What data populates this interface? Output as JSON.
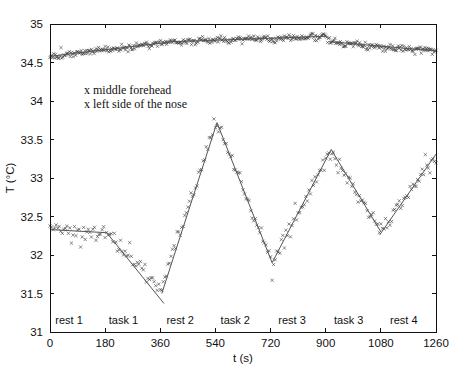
{
  "figure": {
    "background": "#ffffff",
    "axis_color": "#111111",
    "marker_color": "#2e2e2e",
    "fit_line_color": "#555555",
    "text_color": "#111111"
  },
  "chart_data": {
    "type": "scatter",
    "title": "",
    "xlabel": "t (s)",
    "ylabel": "T (°C)",
    "xlim": [
      0,
      1260
    ],
    "ylim": [
      31,
      35
    ],
    "xticks": [
      0,
      180,
      360,
      540,
      720,
      900,
      1080,
      1260
    ],
    "yticks": [
      31,
      31.5,
      32,
      32.5,
      33,
      33.5,
      34,
      34.5,
      35
    ],
    "grid": false,
    "legend_position": "inside-top-left",
    "legend": [
      "x middle forehead",
      "x left side of the nose"
    ],
    "phase_labels": [
      {
        "label": "rest 1",
        "t": 62
      },
      {
        "label": "task 1",
        "t": 240
      },
      {
        "label": "rest 2",
        "t": 425
      },
      {
        "label": "task 2",
        "t": 605
      },
      {
        "label": "rest 3",
        "t": 790
      },
      {
        "label": "task 3",
        "t": 975
      },
      {
        "label": "rest 4",
        "t": 1155
      }
    ],
    "series": [
      {
        "name": "middle forehead",
        "marker": "x",
        "noise_std": 0.022,
        "sample_step": 3,
        "trend": [
          [
            0,
            34.58
          ],
          [
            400,
            34.77
          ],
          [
            900,
            34.84
          ],
          [
            912,
            34.77
          ],
          [
            1260,
            34.65
          ]
        ],
        "fit_segments": [
          [
            [
              0,
              34.58
            ],
            [
              400,
              34.77
            ],
            [
              900,
              34.84
            ]
          ],
          [
            [
              912,
              34.77
            ],
            [
              1260,
              34.65
            ]
          ]
        ]
      },
      {
        "name": "left side of the nose",
        "marker": "x",
        "noise_std": 0.05,
        "sample_step": 5,
        "trend": [
          [
            0,
            32.33
          ],
          [
            185,
            32.3
          ],
          [
            358,
            31.55
          ],
          [
            545,
            33.72
          ],
          [
            725,
            31.9
          ],
          [
            918,
            33.37
          ],
          [
            1078,
            32.32
          ],
          [
            1260,
            33.3
          ]
        ],
        "fit_segments": [
          [
            [
              0,
              32.33
            ],
            [
              185,
              32.29
            ]
          ],
          [
            [
              185,
              32.29
            ],
            [
              372,
              31.37
            ]
          ],
          [
            [
              365,
              31.5
            ],
            [
              545,
              33.72
            ]
          ],
          [
            [
              545,
              33.72
            ],
            [
              725,
              31.9
            ]
          ],
          [
            [
              725,
              31.9
            ],
            [
              918,
              33.37
            ]
          ],
          [
            [
              918,
              33.37
            ],
            [
              1080,
              32.3
            ]
          ],
          [
            [
              1076,
              32.26
            ],
            [
              1260,
              33.31
            ]
          ]
        ]
      }
    ]
  }
}
